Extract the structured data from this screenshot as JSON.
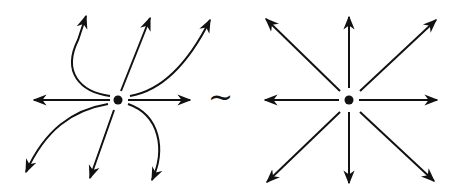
{
  "diagram": {
    "left": {
      "label": "Degenerate node (unstable)",
      "center": [
        118,
        100
      ]
    },
    "relation": {
      "symbol": "~"
    },
    "right": {
      "label": "Star node / dicritical (unstable)",
      "center": [
        349,
        100
      ]
    },
    "colors": {
      "stroke": "#111111",
      "background": "#ffffff"
    }
  }
}
